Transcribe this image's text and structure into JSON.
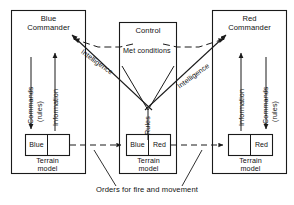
{
  "diagram": {
    "caption": "Orders for fire and movement",
    "blue_side": {
      "title_line1": "Blue",
      "title_line2": "Commander",
      "down_arrow_label_line1": "Commands",
      "down_arrow_label_line2": "(rules)",
      "up_arrow_label": "Information",
      "terrain_cell_left": "Blue",
      "terrain_cell_right": "",
      "terrain_caption_line1": "Terrain",
      "terrain_caption_line2": "model"
    },
    "control_side": {
      "title": "Control",
      "met_label": "Met conditions",
      "rules_label": "Rules",
      "terrain_cell_left": "Blue",
      "terrain_cell_right": "Red",
      "terrain_caption_line1": "Terrain",
      "terrain_caption_line2": "model"
    },
    "red_side": {
      "title_line1": "Red",
      "title_line2": "Commander",
      "up_arrow_label": "Information",
      "down_arrow_label_line1": "Commands",
      "down_arrow_label_line2": "(rules)",
      "terrain_cell_left": "",
      "terrain_cell_right": "Red",
      "terrain_caption_line1": "Terrain",
      "terrain_caption_line2": "model"
    },
    "intelligence_left_label": "Intelligence",
    "intelligence_right_label": "Intelligence",
    "colors": {
      "line": "#1a1a1a",
      "background": "#ffffff",
      "text": "#111111"
    }
  }
}
